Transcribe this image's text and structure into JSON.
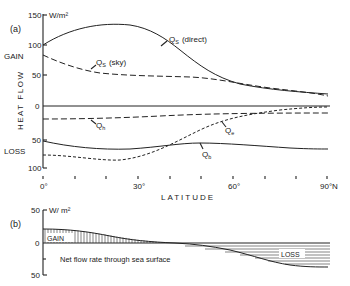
{
  "chart_data": [
    {
      "panel": "(a)",
      "type": "line",
      "title": "",
      "xlabel": "LATITUDE",
      "ylabel": "HEAT FLOW",
      "yunit": "W/m²",
      "x_tick_labels": [
        "0°",
        "30°",
        "60°",
        "90°N"
      ],
      "x": [
        0,
        10,
        20,
        30,
        40,
        50,
        60,
        70,
        80,
        90
      ],
      "xlim": [
        0,
        90
      ],
      "ylim": [
        -100,
        150
      ],
      "y_tick_labels": [
        "150",
        "100",
        "50",
        "0",
        "50",
        "100"
      ],
      "side_labels": {
        "gain": "GAIN",
        "loss": "LOSS"
      },
      "series": [
        {
          "name": "Qs (direct)",
          "style": "solid",
          "values": [
            100,
            122,
            128,
            124,
            108,
            82,
            55,
            38,
            27,
            20
          ]
        },
        {
          "name": "Qs (sky)",
          "style": "long-dash",
          "values": [
            83,
            68,
            58,
            52,
            50,
            48,
            40,
            30,
            23,
            17
          ]
        },
        {
          "name": "Qh",
          "style": "long-dash",
          "values": [
            -20,
            -20,
            -18,
            -15,
            -13,
            -11,
            -10,
            -10,
            -10,
            -10
          ]
        },
        {
          "name": "Qe",
          "style": "short-dash",
          "values": [
            -77,
            -82,
            -86,
            -78,
            -62,
            -40,
            -20,
            -8,
            -4,
            -2
          ]
        },
        {
          "name": "Qb",
          "style": "solid",
          "values": [
            -55,
            -64,
            -66,
            -64,
            -60,
            -55,
            -58,
            -62,
            -64,
            -66
          ]
        },
        {
          "name": "zero",
          "style": "solid",
          "values": [
            0,
            0,
            0,
            0,
            0,
            0,
            0,
            0,
            0,
            0
          ]
        }
      ],
      "annotations": [
        "Qs (direct)",
        "Qs (sky)",
        "Qh",
        "Qe",
        "Qb"
      ]
    },
    {
      "panel": "(b)",
      "type": "area",
      "title": "Net flow rate through sea surface",
      "xlabel": "",
      "ylabel": "",
      "yunit": "W/m²",
      "x": [
        0,
        10,
        20,
        30,
        40,
        50,
        60,
        70,
        80,
        90
      ],
      "xlim": [
        0,
        90
      ],
      "ylim": [
        -50,
        50
      ],
      "y_tick_labels": [
        "50",
        "0",
        "50"
      ],
      "series": [
        {
          "name": "Net flow",
          "values": [
            22,
            20,
            13,
            5,
            0,
            -3,
            -10,
            -22,
            -34,
            -37
          ]
        }
      ],
      "region_labels": {
        "gain": "GAIN",
        "loss": "LOSS"
      }
    }
  ],
  "labels": {
    "panel_a": "(a)",
    "panel_b": "(b)",
    "unit_a": "W/m²",
    "unit_b": "W/ m²",
    "gain": "GAIN",
    "loss": "LOSS",
    "heat_flow": "HEAT FLOW",
    "latitude": "LATITUDE",
    "y150": "150",
    "y100": "100",
    "y50": "50",
    "y0": "0",
    "yn50": "50",
    "yn100": "100",
    "x0": "0°",
    "x30": "30°",
    "x60": "60°",
    "x90": "90°N",
    "b_y50": "50",
    "b_y0": "0",
    "b_yn50": "50",
    "qs_direct": "Q",
    "qs_direct_sub": "S",
    "qs_direct_tail": "(direct)",
    "qs_sky": "Q",
    "qs_sky_sub": "S",
    "qs_sky_tail": "(sky)",
    "qh": "Q",
    "qh_sub": "h",
    "qe": "Q",
    "qe_sub": "e",
    "qb": "Q",
    "qb_sub": "b",
    "b_gain": "GAIN",
    "b_loss": "LOSS",
    "b_caption": "Net flow rate through sea surface"
  }
}
